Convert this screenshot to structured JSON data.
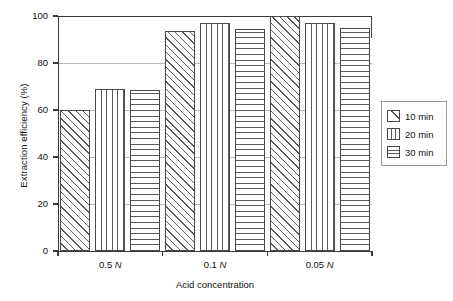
{
  "chart_data": {
    "type": "bar",
    "title": "",
    "xlabel": "Acid concentration",
    "ylabel": "Extraction efficiency (%)",
    "categories": [
      "0.5 N",
      "0.1 N",
      "0.05 N"
    ],
    "category_parts": [
      {
        "value": "0.5",
        "unit": "N"
      },
      {
        "value": "0.1",
        "unit": "N"
      },
      {
        "value": "0.05",
        "unit": "N"
      }
    ],
    "series": [
      {
        "name": "10 min",
        "pattern": "diagonal-hatch",
        "values": [
          60,
          93.5,
          100
        ]
      },
      {
        "name": "20 min",
        "pattern": "vertical-lines",
        "values": [
          69,
          97,
          97
        ]
      },
      {
        "name": "30 min",
        "pattern": "horizontal-lines",
        "values": [
          68.5,
          94.5,
          95
        ]
      }
    ],
    "ylim": [
      0,
      100
    ],
    "yticks": [
      0,
      20,
      40,
      60,
      80,
      100
    ],
    "ytick_labels": [
      "0",
      "20",
      "40",
      "60",
      "80",
      "100"
    ],
    "grid": true,
    "grid_axis": "y",
    "legend_position": "right-outside",
    "colors": {
      "axis": "#3a3a3a",
      "grid": "#b9b9b9",
      "bar_edge": "#4a4a4a",
      "bar_fill": "#ffffff",
      "hatch": "#5a5a5a",
      "background": "#ffffff",
      "text": "#111111"
    }
  },
  "legend": {
    "items": [
      {
        "label": "10 min",
        "swatch": "diagonal-hatch-swatch"
      },
      {
        "label": "20 min",
        "swatch": "vertical-lines-swatch"
      },
      {
        "label": "30 min",
        "swatch": "horizontal-lines-swatch"
      }
    ]
  }
}
